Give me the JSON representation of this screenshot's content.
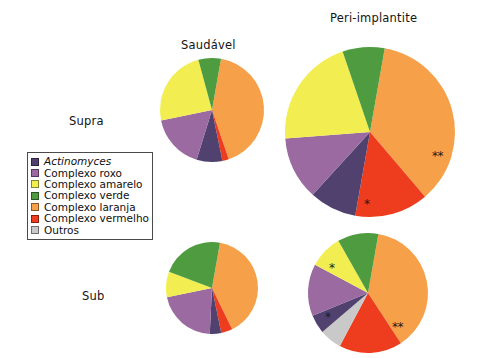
{
  "figure": {
    "column_labels": [
      {
        "text": "Saudável",
        "x": 181,
        "y": 38
      },
      {
        "text": "Peri-implantite",
        "x": 330,
        "y": 11
      }
    ],
    "row_labels": [
      {
        "text": "Supra",
        "x": 69,
        "y": 114
      },
      {
        "text": "Sub",
        "x": 82,
        "y": 289
      }
    ],
    "legend": {
      "title": "",
      "items": [
        {
          "label": "Actinomyces",
          "color": "#51416e",
          "italic": true
        },
        {
          "label": "Complexo roxo",
          "color": "#9a6aa0",
          "italic": false
        },
        {
          "label": "Complexo amarelo",
          "color": "#f2ee52",
          "italic": false
        },
        {
          "label": "Complexo verde",
          "color": "#4f9b3f",
          "italic": false
        },
        {
          "label": "Complexo laranja",
          "color": "#f6a04a",
          "italic": false
        },
        {
          "label": "Complexo vermelho",
          "color": "#ee3d1e",
          "italic": false
        },
        {
          "label": "Outros",
          "color": "#c9c9c9",
          "italic": false
        }
      ]
    }
  },
  "chart_data": {
    "type": "pie",
    "title": "",
    "legend_position": "left",
    "category_colors": {
      "Actinomyces": "#51416e",
      "Complexo roxo": "#9a6aa0",
      "Complexo amarelo": "#f2ee52",
      "Complexo verde": "#4f9b3f",
      "Complexo laranja": "#f6a04a",
      "Complexo vermelho": "#ee3d1e",
      "Outros": "#c9c9c9"
    },
    "categories": [
      "Complexo laranja",
      "Complexo vermelho",
      "Actinomyces",
      "Complexo roxo",
      "Outros",
      "Complexo amarelo",
      "Complexo verde"
    ],
    "charts": [
      {
        "name": "saudavel-supra",
        "column": "Saudável",
        "row": "Supra",
        "cx": 212,
        "cy": 110,
        "r": 52,
        "start_angle": -80,
        "slices": [
          {
            "label": "Complexo laranja",
            "value": 42
          },
          {
            "label": "Complexo vermelho",
            "value": 2
          },
          {
            "label": "Actinomyces",
            "value": 8
          },
          {
            "label": "Complexo roxo",
            "value": 17
          },
          {
            "label": "Outros",
            "value": 0
          },
          {
            "label": "Complexo amarelo",
            "value": 24
          },
          {
            "label": "Complexo verde",
            "value": 7
          }
        ],
        "markers": []
      },
      {
        "name": "peri-implantite-supra",
        "column": "Peri-implantite",
        "row": "Supra",
        "cx": 370,
        "cy": 132,
        "r": 85,
        "start_angle": -80,
        "slices": [
          {
            "label": "Complexo laranja",
            "value": 36
          },
          {
            "label": "Complexo vermelho",
            "value": 14
          },
          {
            "label": "Actinomyces",
            "value": 9
          },
          {
            "label": "Complexo roxo",
            "value": 12
          },
          {
            "label": "Outros",
            "value": 0
          },
          {
            "label": "Complexo amarelo",
            "value": 21
          },
          {
            "label": "Complexo verde",
            "value": 8
          }
        ],
        "markers": [
          {
            "text": "**",
            "x": 432,
            "y": 150
          },
          {
            "text": "*",
            "x": 364,
            "y": 198
          }
        ]
      },
      {
        "name": "saudavel-sub",
        "column": "Saudável",
        "row": "Sub",
        "cx": 212,
        "cy": 288,
        "r": 46,
        "start_angle": -80,
        "slices": [
          {
            "label": "Complexo laranja",
            "value": 40
          },
          {
            "label": "Complexo vermelho",
            "value": 4
          },
          {
            "label": "Actinomyces",
            "value": 4
          },
          {
            "label": "Complexo roxo",
            "value": 21
          },
          {
            "label": "Outros",
            "value": 0
          },
          {
            "label": "Complexo amarelo",
            "value": 9
          },
          {
            "label": "Complexo verde",
            "value": 22
          }
        ],
        "markers": []
      },
      {
        "name": "peri-implantite-sub",
        "column": "Peri-implantite",
        "row": "Sub",
        "cx": 368,
        "cy": 293,
        "r": 60,
        "start_angle": -80,
        "slices": [
          {
            "label": "Complexo laranja",
            "value": 38
          },
          {
            "label": "Complexo vermelho",
            "value": 17
          },
          {
            "label": "Outros",
            "value": 6
          },
          {
            "label": "Actinomyces",
            "value": 5
          },
          {
            "label": "Complexo roxo",
            "value": 14
          },
          {
            "label": "Complexo amarelo",
            "value": 9
          },
          {
            "label": "Complexo verde",
            "value": 11
          }
        ],
        "markers": [
          {
            "text": "**",
            "x": 392,
            "y": 321
          },
          {
            "text": "*",
            "x": 325,
            "y": 311
          },
          {
            "text": "*",
            "x": 329,
            "y": 262
          }
        ]
      }
    ]
  }
}
